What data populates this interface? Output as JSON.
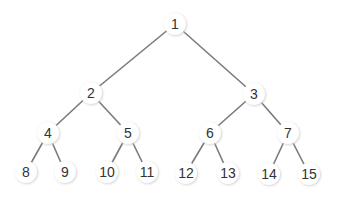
{
  "diagram": {
    "type": "binary-tree",
    "edge_color": "#7a7a7a",
    "node_fill": "#ffffff",
    "node_shadow": "#dddddd",
    "text_color": "#333333",
    "nodes": [
      {
        "id": 1,
        "label": "1",
        "x": 175,
        "y": 24
      },
      {
        "id": 2,
        "label": "2",
        "x": 91,
        "y": 93
      },
      {
        "id": 3,
        "label": "3",
        "x": 254,
        "y": 94
      },
      {
        "id": 4,
        "label": "4",
        "x": 48,
        "y": 133
      },
      {
        "id": 5,
        "label": "5",
        "x": 128,
        "y": 133
      },
      {
        "id": 6,
        "label": "6",
        "x": 210,
        "y": 133
      },
      {
        "id": 7,
        "label": "7",
        "x": 288,
        "y": 133
      },
      {
        "id": 8,
        "label": "8",
        "x": 26,
        "y": 172
      },
      {
        "id": 9,
        "label": "9",
        "x": 65,
        "y": 172
      },
      {
        "id": 10,
        "label": "10",
        "x": 107,
        "y": 172
      },
      {
        "id": 11,
        "label": "11",
        "x": 147,
        "y": 172
      },
      {
        "id": 12,
        "label": "12",
        "x": 186,
        "y": 173
      },
      {
        "id": 13,
        "label": "13",
        "x": 228,
        "y": 173
      },
      {
        "id": 14,
        "label": "14",
        "x": 269,
        "y": 174
      },
      {
        "id": 15,
        "label": "15",
        "x": 309,
        "y": 174
      }
    ],
    "edges": [
      [
        1,
        2
      ],
      [
        1,
        3
      ],
      [
        2,
        4
      ],
      [
        2,
        5
      ],
      [
        3,
        6
      ],
      [
        3,
        7
      ],
      [
        4,
        8
      ],
      [
        4,
        9
      ],
      [
        5,
        10
      ],
      [
        5,
        11
      ],
      [
        6,
        12
      ],
      [
        6,
        13
      ],
      [
        7,
        14
      ],
      [
        7,
        15
      ]
    ]
  }
}
